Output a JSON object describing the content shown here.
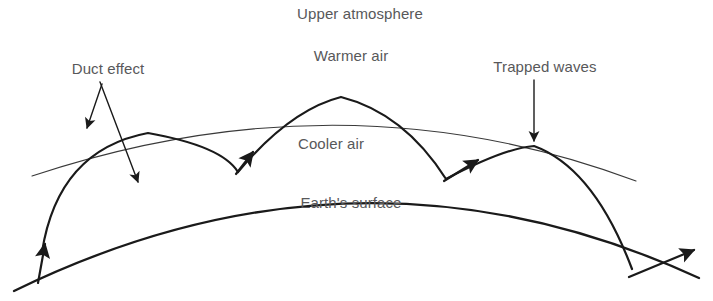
{
  "diagram": {
    "background_color": "#ffffff",
    "stroke_color": "#1a1a1a",
    "text_color": "#58585a",
    "labels": {
      "upper_atmosphere": "Upper atmosphere",
      "warmer_air": "Warmer air",
      "cooler_air": "Cooler air",
      "earths_surface": "Earth's surface",
      "duct_effect": "Duct effect",
      "trapped_waves": "Trapped waves"
    },
    "label_positions": {
      "upper_atmosphere": {
        "x": 360,
        "y": 13
      },
      "warmer_air": {
        "x": 351,
        "y": 55
      },
      "cooler_air": {
        "x": 331,
        "y": 143
      },
      "earths_surface": {
        "x": 351,
        "y": 202
      },
      "duct_effect": {
        "x": 108,
        "y": 68
      },
      "trapped_waves": {
        "x": 545,
        "y": 66
      }
    },
    "geometry": {
      "earth_surface_arc": "M 14,291 Q 360,122 699,278",
      "warmer_air_arc": "M 32,176 Q 345,72 636,181",
      "wave_hops": [
        "M 42,252 Q 58,150 148,133 Q 222,146 238,172",
        "M 238,172 Q 290,110 341,97 Q 404,113 446,179",
        "M 446,179 Q 505,148 534,146 Q 594,168 632,269"
      ],
      "entry_arrow": "M 38,281 L 45,245",
      "exit_arrow": "M 628,276 L 692,251",
      "duct_arrow_short": "M 102,84 L 87,128",
      "duct_arrow_long": "M 100,82 L 138,182",
      "trapped_waves_arrow": "M 534,80 L 534,141"
    }
  }
}
